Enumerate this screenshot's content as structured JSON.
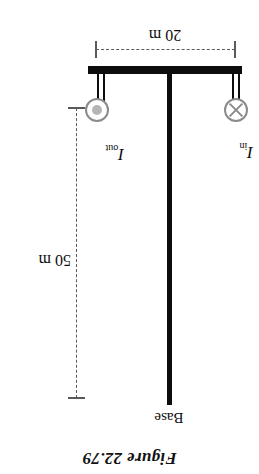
{
  "figure": {
    "title": "Figure 22.79",
    "orientation_degrees": 180,
    "base_label": "Base",
    "currents": [
      {
        "id": "current-in",
        "label_symbol": "I",
        "label_subscript": "in",
        "icon": "circle-x-icon",
        "direction": "into-page"
      },
      {
        "id": "current-out",
        "label_symbol": "I",
        "label_subscript": "out",
        "icon": "circle-dot-icon",
        "direction": "out-of-page"
      }
    ],
    "dimensions": [
      {
        "id": "height-dimension",
        "value": "50 m",
        "axis": "vertical"
      },
      {
        "id": "width-dimension",
        "value": "20 m",
        "axis": "horizontal"
      }
    ],
    "colors": {
      "structure": "#0d0d0d",
      "dimension_line": "#5a5a5a",
      "symbol_stroke": "#8a8a8a",
      "symbol_dot": "#b5b5b5",
      "background": "#ffffff"
    }
  }
}
